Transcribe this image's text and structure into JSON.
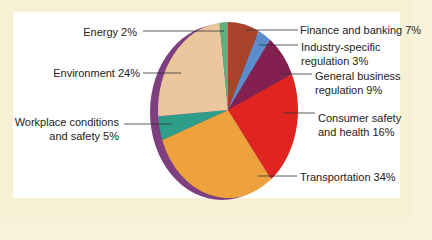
{
  "chart_data": {
    "type": "pie",
    "title": "",
    "categories": [
      "Finance and banking",
      "Industry-specific regulation",
      "General business regulation",
      "Consumer safety and health",
      "Transportation",
      "Workplace conditions and safety",
      "Environment",
      "Energy"
    ],
    "values": [
      7,
      3,
      9,
      16,
      34,
      5,
      24,
      2
    ],
    "unit": "%",
    "colors": [
      "#a9442a",
      "#5b8ccc",
      "#84204f",
      "#e0241f",
      "#eda23d",
      "#2e9e8a",
      "#ecc79d",
      "#5fb07a"
    ],
    "rim_color": "#7e3f80",
    "legend_position": "callout labels",
    "grid": false
  },
  "labels": {
    "finance": "Finance and banking 7%",
    "industry_1": "Industry-specific",
    "industry_2": "regulation 3%",
    "general_1": "General business",
    "general_2": "regulation 9%",
    "consumer_1": "Consumer safety",
    "consumer_2": "and health 16%",
    "transportation": "Transportation 34%",
    "workplace_1": "Workplace conditions",
    "workplace_2": "and safety 5%",
    "environment": "Environment 24%",
    "energy": "Energy 2%"
  }
}
